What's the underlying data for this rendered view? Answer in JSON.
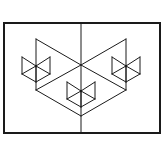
{
  "figure": {
    "stroke_color": "#1a1a1a",
    "background": "#ffffff",
    "frame": {
      "x": 4,
      "y": 23,
      "width": 156,
      "height": 110,
      "stroke_width": 2
    },
    "center_axis": {
      "x": 81,
      "y1": 23,
      "y2": 133
    },
    "large_shape": {
      "stroke_width": 1,
      "segments": [
        [
          36,
          39,
          36,
          90
        ],
        [
          36,
          39,
          81,
          65
        ],
        [
          81,
          65,
          126,
          39
        ],
        [
          126,
          39,
          126,
          90
        ],
        [
          36,
          90,
          81,
          65
        ],
        [
          81,
          65,
          126,
          90
        ],
        [
          36,
          90,
          81,
          116
        ],
        [
          81,
          116,
          126,
          90
        ]
      ]
    },
    "small_figures": [
      {
        "name": "left",
        "cx": 36,
        "cy": 66
      },
      {
        "name": "middle",
        "cx": 81,
        "cy": 91
      },
      {
        "name": "right",
        "cx": 126,
        "cy": 66
      }
    ],
    "small_figure_geometry": {
      "half_width": 14,
      "top_offset": -9,
      "side_bottom_offset": 8,
      "bottom_offset": 16
    }
  }
}
